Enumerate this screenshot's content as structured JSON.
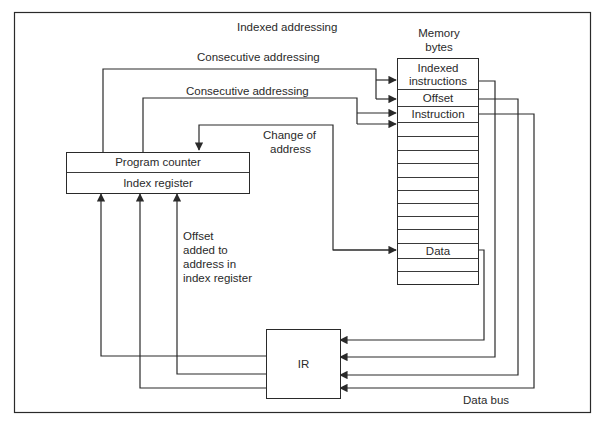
{
  "diagram": {
    "labels": {
      "indexed_addressing": "Indexed addressing",
      "consecutive_addressing_1": "Consecutive addressing",
      "consecutive_addressing_2": "Consecutive addressing",
      "change_of_address_1": "Change of",
      "change_of_address_2": "address",
      "memory_title_1": "Memory",
      "memory_title_2": "bytes",
      "offset_note": [
        "Offset",
        "added to",
        "address in",
        "index register"
      ],
      "data_bus": "Data bus"
    },
    "registers": {
      "program_counter": "Program counter",
      "index_register": "Index register",
      "ir": "IR"
    },
    "memory": {
      "rows": [
        {
          "label": "Indexed\ninstructions",
          "line1": "Indexed",
          "line2": "instructions"
        },
        {
          "label": "Offset"
        },
        {
          "label": "Instruction"
        },
        {
          "label": ""
        },
        {
          "label": ""
        },
        {
          "label": ""
        },
        {
          "label": ""
        },
        {
          "label": ""
        },
        {
          "label": ""
        },
        {
          "label": ""
        },
        {
          "label": ""
        },
        {
          "label": "Data"
        },
        {
          "label": ""
        },
        {
          "label": ""
        }
      ]
    },
    "colors": {
      "line": "#2a2a2a",
      "background": "#ffffff"
    }
  }
}
